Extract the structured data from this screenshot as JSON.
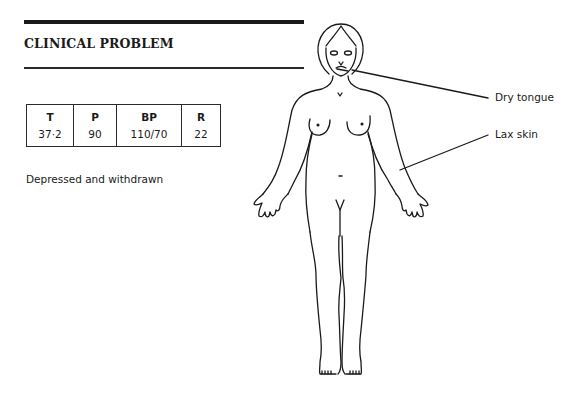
{
  "header": {
    "title": "CLINICAL PROBLEM"
  },
  "vitals": {
    "columns": [
      "T",
      "P",
      "BP",
      "R"
    ],
    "values": [
      "37·2",
      "90",
      "110/70",
      "22"
    ]
  },
  "note": "Depressed and withdrawn",
  "annotations": {
    "dry_tongue": "Dry tongue",
    "lax_skin": "Lax skin"
  }
}
